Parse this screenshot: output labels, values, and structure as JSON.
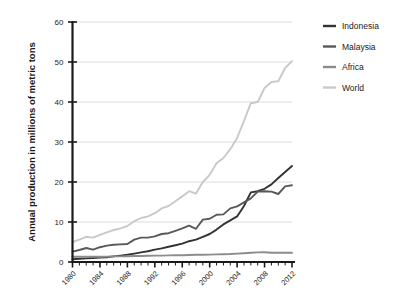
{
  "chart_data": {
    "type": "line",
    "title": "",
    "xlabel": "",
    "ylabel": "Annual production in millions of metric tons",
    "xlim": [
      1980,
      2012
    ],
    "ylim": [
      0,
      60
    ],
    "ytick_values": [
      0,
      10,
      20,
      30,
      40,
      50,
      60
    ],
    "ytick_labels": [
      "0",
      "10",
      "20",
      "30",
      "40",
      "50",
      "60"
    ],
    "xtick_values": [
      1980,
      1984,
      1988,
      1992,
      1996,
      2000,
      2004,
      2008,
      2012
    ],
    "xtick_labels": [
      "1980",
      "1984",
      "1988",
      "1992",
      "1996",
      "2000",
      "2004",
      "2008",
      "2012"
    ],
    "xtick_minor_step": 1,
    "grid": "horizontal",
    "legend_position": "right",
    "x": [
      1980,
      1981,
      1982,
      1983,
      1984,
      1985,
      1986,
      1987,
      1988,
      1989,
      1990,
      1991,
      1992,
      1993,
      1994,
      1995,
      1996,
      1997,
      1998,
      1999,
      2000,
      2001,
      2002,
      2003,
      2004,
      2005,
      2006,
      2007,
      2008,
      2009,
      2010,
      2011,
      2012
    ],
    "series": [
      {
        "name": "Indonesia",
        "color": "#333333",
        "values": [
          0.7,
          0.8,
          0.9,
          1.0,
          1.1,
          1.2,
          1.4,
          1.6,
          1.8,
          2.1,
          2.4,
          2.7,
          3.1,
          3.4,
          3.8,
          4.2,
          4.6,
          5.2,
          5.6,
          6.3,
          7.0,
          8.1,
          9.4,
          10.4,
          11.4,
          14.0,
          17.4,
          17.7,
          18.3,
          19.4,
          21.0,
          22.5,
          24.0
        ]
      },
      {
        "name": "Malaysia",
        "color": "#595959",
        "values": [
          2.6,
          3.0,
          3.5,
          3.1,
          3.7,
          4.1,
          4.3,
          4.4,
          4.5,
          5.6,
          6.1,
          6.1,
          6.4,
          7.0,
          7.2,
          7.8,
          8.4,
          9.1,
          8.3,
          10.6,
          10.8,
          11.8,
          11.9,
          13.4,
          13.9,
          14.9,
          15.9,
          17.6,
          17.7,
          17.6,
          17.0,
          18.9,
          19.2
        ]
      },
      {
        "name": "Africa",
        "color": "#8c8c8c",
        "values": [
          1.3,
          1.3,
          1.3,
          1.3,
          1.3,
          1.35,
          1.4,
          1.4,
          1.45,
          1.5,
          1.5,
          1.55,
          1.6,
          1.6,
          1.65,
          1.7,
          1.7,
          1.75,
          1.8,
          1.8,
          1.85,
          1.9,
          1.95,
          2.0,
          2.1,
          2.2,
          2.3,
          2.4,
          2.45,
          2.3,
          2.3,
          2.3,
          2.3
        ]
      },
      {
        "name": "World",
        "color": "#c9c9c9",
        "values": [
          5.0,
          5.6,
          6.3,
          6.1,
          6.8,
          7.4,
          8.0,
          8.4,
          9.0,
          10.2,
          11.0,
          11.4,
          12.2,
          13.4,
          14.0,
          15.2,
          16.4,
          17.7,
          17.1,
          20.0,
          21.8,
          24.7,
          26.0,
          28.2,
          31.0,
          35.3,
          39.7,
          40.0,
          43.5,
          45.0,
          45.2,
          48.5,
          50.2
        ]
      }
    ]
  },
  "legend": {
    "items": [
      {
        "label": "Indonesia",
        "color": "#333333"
      },
      {
        "label": "Malaysia",
        "color": "#595959"
      },
      {
        "label": "Africa",
        "color": "#8c8c8c"
      },
      {
        "label": "World",
        "color": "#c9c9c9"
      }
    ]
  },
  "axes": {
    "y_axis_title": "Annual production in millions of metric tons"
  }
}
